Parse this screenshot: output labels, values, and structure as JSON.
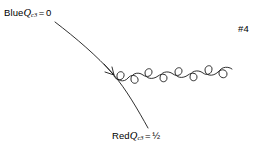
{
  "figure": {
    "background_color": "#ffffff",
    "stroke_color": "#1a1a1a",
    "width": 269,
    "height": 150,
    "number_label": "#4"
  },
  "labels": {
    "blue": {
      "prefix": "Blue",
      "symbol": "Q",
      "subscript": "c3",
      "equals": "=",
      "value": "0",
      "full_text": "Blue Qc3 = 0"
    },
    "red": {
      "prefix": "Red",
      "symbol": "Q",
      "subscript": "c3",
      "equals": "=",
      "value": "½",
      "full_text": "Red Qc3 = ½"
    }
  },
  "diagram_data": {
    "type": "feynman-diagram",
    "description": "A curved fermion line with a directional arrow emitting a coiled gluon line toward the upper right.",
    "elements": [
      {
        "name": "fermion-line",
        "kind": "curve",
        "start": [
          55,
          22
        ],
        "end": [
          148,
          128
        ],
        "arrow_at": [
          113,
          73
        ],
        "arrow_direction": "up-left"
      },
      {
        "name": "gluon-coil",
        "kind": "coil",
        "start": [
          114,
          76
        ],
        "end": [
          222,
          30
        ],
        "loops": 8
      }
    ]
  }
}
